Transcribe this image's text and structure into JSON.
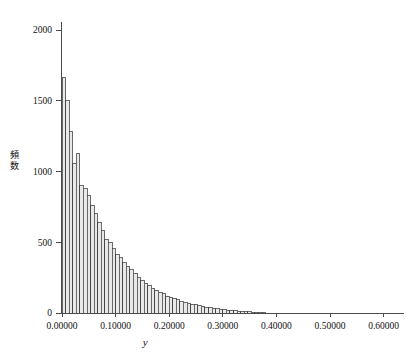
{
  "chart_data": {
    "type": "bar",
    "subtype": "histogram",
    "title": "",
    "subtitle": "",
    "xlabel": "y",
    "ylabel": "頻数",
    "xlim": [
      -0.02,
      0.66
    ],
    "ylim": [
      0,
      2150
    ],
    "grid": false,
    "legend": null,
    "bar_fill_color": "#e9e9e9",
    "bar_edge_color": "#3c3c3c",
    "axis_color": "#4a4a4a",
    "text_color": "#101010",
    "xticks": [
      0.0,
      0.1,
      0.2,
      0.3,
      0.4,
      0.5,
      0.6
    ],
    "xtick_labels": [
      "0.00000",
      "0.10000",
      "0.20000",
      "0.30000",
      "0.40000",
      "0.50000",
      "0.60000"
    ],
    "yticks": [
      0,
      500,
      1000,
      1500,
      2000
    ],
    "ytick_labels": [
      "0",
      "500",
      "1000",
      "1500",
      "2000"
    ],
    "bin_width": 0.006667,
    "bin_starts": [
      0.0,
      0.006667,
      0.013333,
      0.02,
      0.026667,
      0.033333,
      0.04,
      0.046667,
      0.053333,
      0.06,
      0.066667,
      0.073333,
      0.08,
      0.086667,
      0.093333,
      0.1,
      0.106667,
      0.113333,
      0.12,
      0.126667,
      0.133333,
      0.14,
      0.146667,
      0.153333,
      0.16,
      0.166667,
      0.173333,
      0.18,
      0.186667,
      0.193333,
      0.2,
      0.206667,
      0.213333,
      0.22,
      0.226667,
      0.233333,
      0.24,
      0.246667,
      0.253333,
      0.26,
      0.266667,
      0.273333,
      0.28,
      0.286667,
      0.293333,
      0.3,
      0.306667,
      0.313333,
      0.32,
      0.326667,
      0.333333,
      0.34,
      0.346667,
      0.353333,
      0.36,
      0.366667,
      0.373333
    ],
    "values": [
      1665,
      1500,
      1280,
      1060,
      1130,
      900,
      880,
      830,
      760,
      700,
      640,
      580,
      520,
      495,
      455,
      415,
      390,
      355,
      330,
      305,
      280,
      250,
      230,
      210,
      195,
      175,
      160,
      145,
      135,
      120,
      110,
      100,
      92,
      84,
      76,
      70,
      62,
      57,
      52,
      46,
      42,
      38,
      34,
      30,
      27,
      24,
      21,
      18,
      16,
      14,
      12,
      10,
      8,
      7,
      5,
      4,
      3
    ]
  }
}
